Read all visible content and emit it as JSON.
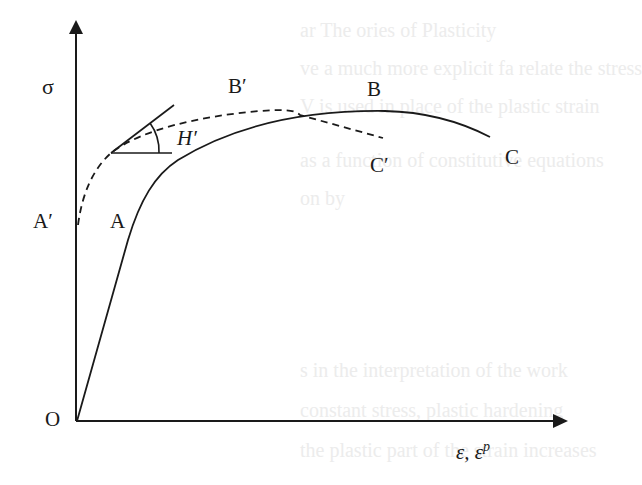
{
  "figure": {
    "type": "stress-strain diagram",
    "axes": {
      "y_label": "σ",
      "x_label": "ε, ε",
      "x_label_superscript": "p",
      "origin_label": "O"
    },
    "curves": [
      {
        "name": "solid",
        "style": "solid",
        "points_labels": [
          "A",
          "B",
          "C"
        ]
      },
      {
        "name": "dashed",
        "style": "dashed",
        "points_labels": [
          "A′",
          "B′",
          "C′"
        ]
      }
    ],
    "labels": {
      "A": "A",
      "A_prime": "A′",
      "B": "B",
      "B_prime": "B′",
      "C": "C",
      "C_prime": "C′",
      "H_prime": "H′"
    },
    "colors": {
      "ink": "#1a1a1a",
      "background": "#ffffff",
      "bleed_through": "#ececec"
    }
  },
  "bleed_through_text": [
    "ar The ories of Plasticity",
    "ve a much more explicit fa relate the stress",
    "V     is used in place of the plastic strain",
    "as a function of     constitutive equations",
    "on by",
    "s in the interpretation of the work",
    "constant stress, plastic hardening",
    "the plastic part of the strain increases"
  ]
}
